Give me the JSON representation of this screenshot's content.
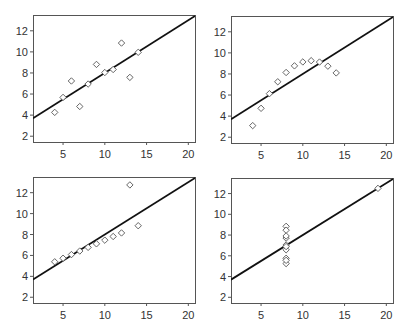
{
  "chart_data": [
    {
      "type": "scatter",
      "title": "",
      "xlabel": "",
      "ylabel": "",
      "xlim": [
        1.4,
        20.8
      ],
      "ylim": [
        1.45,
        13.5
      ],
      "xticks": [
        5,
        10,
        15,
        20
      ],
      "yticks": [
        2,
        4,
        6,
        8,
        10,
        12
      ],
      "grid": false,
      "marker": "diamond-open",
      "fit_line": {
        "intercept": 3.0,
        "slope": 0.5
      },
      "x": [
        10,
        8,
        13,
        9,
        11,
        14,
        6,
        4,
        12,
        7,
        5
      ],
      "y": [
        8.04,
        6.95,
        7.58,
        8.81,
        8.33,
        9.96,
        7.24,
        4.26,
        10.84,
        4.82,
        5.68
      ]
    },
    {
      "type": "scatter",
      "title": "",
      "xlabel": "",
      "ylabel": "",
      "xlim": [
        1.4,
        20.8
      ],
      "ylim": [
        1.45,
        13.5
      ],
      "xticks": [
        5,
        10,
        15,
        20
      ],
      "yticks": [
        2,
        4,
        6,
        8,
        10,
        12
      ],
      "grid": false,
      "marker": "diamond-open",
      "fit_line": {
        "intercept": 3.0,
        "slope": 0.5
      },
      "x": [
        10,
        8,
        13,
        9,
        11,
        14,
        6,
        4,
        12,
        7,
        5
      ],
      "y": [
        9.14,
        8.14,
        8.74,
        8.77,
        9.26,
        8.1,
        6.13,
        3.1,
        9.13,
        7.26,
        4.74
      ]
    },
    {
      "type": "scatter",
      "title": "",
      "xlabel": "",
      "ylabel": "",
      "xlim": [
        1.4,
        20.8
      ],
      "ylim": [
        1.45,
        13.5
      ],
      "xticks": [
        5,
        10,
        15,
        20
      ],
      "yticks": [
        2,
        4,
        6,
        8,
        10,
        12
      ],
      "grid": false,
      "marker": "diamond-open",
      "fit_line": {
        "intercept": 3.0,
        "slope": 0.5
      },
      "x": [
        10,
        8,
        13,
        9,
        11,
        14,
        6,
        4,
        12,
        7,
        5
      ],
      "y": [
        7.46,
        6.77,
        12.74,
        7.11,
        7.81,
        8.84,
        6.08,
        5.39,
        8.15,
        6.42,
        5.73
      ]
    },
    {
      "type": "scatter",
      "title": "",
      "xlabel": "",
      "ylabel": "",
      "xlim": [
        1.4,
        20.8
      ],
      "ylim": [
        1.45,
        13.5
      ],
      "xticks": [
        5,
        10,
        15,
        20
      ],
      "yticks": [
        2,
        4,
        6,
        8,
        10,
        12
      ],
      "grid": false,
      "marker": "diamond-open",
      "fit_line": {
        "intercept": 3.0,
        "slope": 0.5
      },
      "x": [
        8,
        8,
        8,
        8,
        8,
        8,
        8,
        19,
        8,
        8,
        8
      ],
      "y": [
        6.58,
        5.76,
        7.71,
        8.84,
        8.47,
        7.04,
        5.25,
        12.5,
        5.56,
        7.91,
        6.89
      ]
    }
  ],
  "panels": [
    {
      "left": 33,
      "top": 15,
      "right": 195,
      "bottom": 142
    },
    {
      "left": 231,
      "top": 16,
      "right": 393,
      "bottom": 143
    },
    {
      "left": 33,
      "top": 177,
      "right": 195,
      "bottom": 303
    },
    {
      "left": 231,
      "top": 178,
      "right": 393,
      "bottom": 303
    }
  ],
  "colors": {
    "frame": "#555555",
    "fit_line": "#111111",
    "marker": "#555555",
    "text": "#333333"
  }
}
